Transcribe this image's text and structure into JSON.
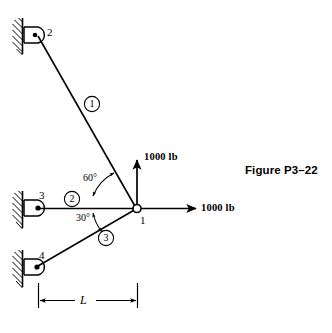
{
  "figure": {
    "caption": "Figure P3–22",
    "nodes": [
      {
        "id": "1",
        "label": "1",
        "x": 137,
        "y": 209,
        "kind": "free-joint"
      },
      {
        "id": "2",
        "label": "2",
        "x": 40,
        "y": 35,
        "kind": "pin-support-wall-left"
      },
      {
        "id": "3",
        "label": "3",
        "x": 40,
        "y": 208,
        "kind": "pin-support-wall-left"
      },
      {
        "id": "4",
        "label": "4",
        "x": 40,
        "y": 267,
        "kind": "pin-support-wall-left"
      }
    ],
    "members": [
      {
        "label": "1",
        "from": "2",
        "to": "1"
      },
      {
        "label": "2",
        "from": "3",
        "to": "1"
      },
      {
        "label": "3",
        "from": "4",
        "to": "1"
      }
    ],
    "angles": [
      {
        "label": "60°",
        "value": 60,
        "between": "member-1 and member-2"
      },
      {
        "label": "30°",
        "value": 30,
        "between": "member-2 and member-3"
      }
    ],
    "loads": [
      {
        "label": "1000 lb",
        "magnitude": 1000,
        "unit": "lb",
        "direction": "up",
        "at_node": "1"
      },
      {
        "label": "1000 lb",
        "magnitude": 1000,
        "unit": "lb",
        "direction": "right",
        "at_node": "1"
      }
    ],
    "dimension": {
      "label": "L",
      "from_x": 38,
      "to_x": 137,
      "y": 300
    },
    "colors": {
      "ink": "#000000",
      "background": "#ffffff"
    }
  }
}
